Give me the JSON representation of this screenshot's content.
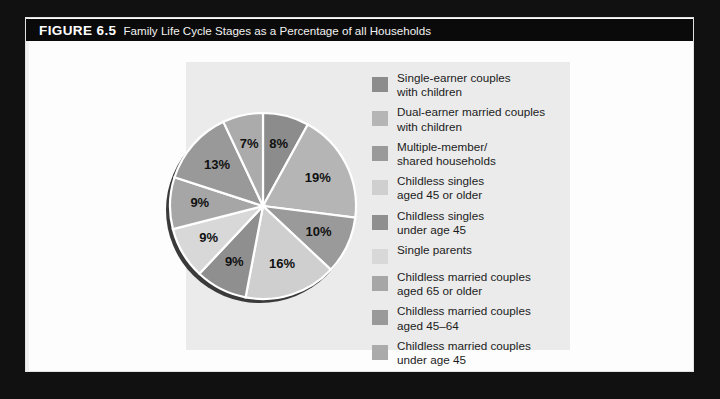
{
  "figure": {
    "number_label": "FIGURE 6.5",
    "caption": "Family Life Cycle Stages as a Percentage of all Households"
  },
  "chart_data": {
    "type": "pie",
    "title": "Family Life Cycle Stages as a Percentage of all Households",
    "units": "percent of all households",
    "start_angle_deg": 0,
    "direction": "clockwise",
    "total": 100,
    "legend_position": "right",
    "categories": [
      "Single-earner couples with children",
      "Dual-earner married couples with children",
      "Multiple-member/ shared households",
      "Childless singles aged 45 or older",
      "Childless singles under age 45",
      "Single parents",
      "Childless married couples aged 65 or older",
      "Childless married couples aged 45–64",
      "Childless married couples under age 45"
    ],
    "values": [
      8,
      19,
      10,
      16,
      9,
      9,
      9,
      13,
      7
    ],
    "data_labels": [
      "8%",
      "19%",
      "10%",
      "16%",
      "9%",
      "9%",
      "9%",
      "13%",
      "7%"
    ],
    "colors": [
      "#8c8c8c",
      "#b5b5b5",
      "#9a9a9a",
      "#cfcfcf",
      "#8f8f8f",
      "#d8d8d8",
      "#a6a6a6",
      "#999999",
      "#ababab"
    ],
    "slices": [
      {
        "label": "8%",
        "value": 8,
        "color": "#8c8c8c",
        "legend": "Single-earner couples\nwith children"
      },
      {
        "label": "19%",
        "value": 19,
        "color": "#b5b5b5",
        "legend": "Dual-earner married couples\nwith children"
      },
      {
        "label": "10%",
        "value": 10,
        "color": "#9a9a9a",
        "legend": "Multiple-member/\nshared households"
      },
      {
        "label": "16%",
        "value": 16,
        "color": "#cfcfcf",
        "legend": "Childless singles\naged 45 or older"
      },
      {
        "label": "9%",
        "value": 9,
        "color": "#8f8f8f",
        "legend": "Childless singles\nunder age 45"
      },
      {
        "label": "9%",
        "value": 9,
        "color": "#d8d8d8",
        "legend": "Single parents"
      },
      {
        "label": "9%",
        "value": 9,
        "color": "#a6a6a6",
        "legend": "Childless married couples\naged 65 or older"
      },
      {
        "label": "13%",
        "value": 13,
        "color": "#999999",
        "legend": "Childless married couples\naged 45–64"
      },
      {
        "label": "7%",
        "value": 7,
        "color": "#ababab",
        "legend": "Childless married couples\nunder age 45"
      }
    ]
  },
  "legend": {
    "items": [
      {
        "label": "Single-earner couples\nwith children",
        "color": "#8c8c8c"
      },
      {
        "label": "Dual-earner married couples\nwith children",
        "color": "#b5b5b5"
      },
      {
        "label": "Multiple-member/\nshared households",
        "color": "#9a9a9a"
      },
      {
        "label": "Childless singles\naged 45 or older",
        "color": "#cfcfcf"
      },
      {
        "label": "Childless singles\nunder age 45",
        "color": "#8f8f8f"
      },
      {
        "label": "Single parents",
        "color": "#d8d8d8"
      },
      {
        "label": "Childless married couples\naged 65 or older",
        "color": "#a6a6a6"
      },
      {
        "label": "Childless married couples\naged 45–64",
        "color": "#999999"
      },
      {
        "label": "Childless married couples\nunder age 45",
        "color": "#ababab"
      }
    ]
  },
  "style": {
    "page_background": "#fdfdfd",
    "outer_background": "#111111",
    "panel_background": "#ebebeb",
    "title_bar_background": "#0a0a0a",
    "title_text_color": "#ffffff",
    "slice_separator_color": "#ffffff",
    "shadow_color": "#3a3a3a"
  }
}
